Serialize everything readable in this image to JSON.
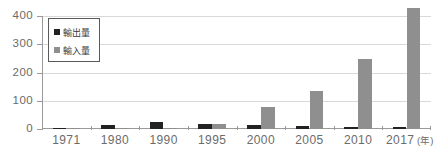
{
  "chart_data": {
    "type": "bar",
    "title": "",
    "xlabel": "年",
    "ylabel": "",
    "categories": [
      "1971",
      "1980",
      "1990",
      "1995",
      "2000",
      "2005",
      "2010",
      "2017"
    ],
    "series": [
      {
        "name": "輸出量",
        "color": "#222222",
        "values": [
          2,
          15,
          25,
          18,
          13,
          11,
          6,
          8
        ]
      },
      {
        "name": "輸入量",
        "color": "#8f8f8f",
        "values": [
          1,
          1,
          3,
          18,
          77,
          133,
          247,
          428
        ]
      }
    ],
    "ylim": [
      0,
      400
    ],
    "yticks": [
      0,
      100,
      200,
      300,
      400
    ],
    "ytick_labels": [
      "0",
      "100",
      "200",
      "300",
      "400"
    ],
    "grid": true,
    "legend_position": "top-left"
  },
  "axis": {
    "x_unit_label": "(年)"
  }
}
